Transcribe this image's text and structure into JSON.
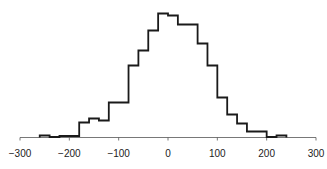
{
  "chart_data": {
    "type": "bar",
    "style": "step-histogram",
    "title": "",
    "xlabel": "",
    "ylabel": "",
    "xlim": [
      -300,
      300
    ],
    "grid": false,
    "legend": null,
    "x_ticks": [
      -300,
      -200,
      -100,
      0,
      100,
      200,
      300
    ],
    "x_tick_labels": [
      "−300",
      "−200",
      "−100",
      "0",
      "100",
      "200",
      "300"
    ],
    "bin_edges": [
      -260,
      -240,
      -220,
      -200,
      -180,
      -160,
      -140,
      -120,
      -100,
      -80,
      -60,
      -40,
      -20,
      0,
      20,
      40,
      60,
      80,
      100,
      120,
      140,
      160,
      180,
      200,
      220,
      240
    ],
    "values": [
      2,
      0.5,
      1.5,
      1.5,
      15,
      19,
      17,
      35,
      35,
      72,
      87,
      107,
      124,
      122,
      113,
      113,
      94,
      72,
      40,
      23,
      14,
      6,
      6,
      0.5,
      2
    ],
    "y_units": "relative frequency (no axis shown)"
  }
}
